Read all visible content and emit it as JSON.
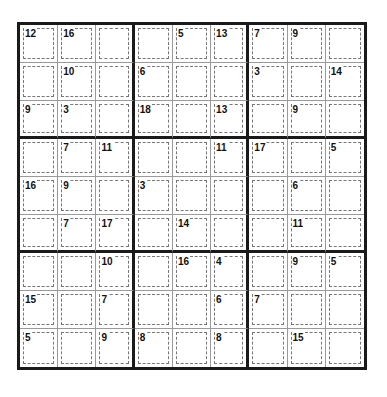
{
  "puzzle": {
    "type": "Killer Sudoku",
    "size": 9,
    "cage_sums": [
      [
        "12",
        "16",
        "",
        "",
        "5",
        "13",
        "7",
        "9",
        ""
      ],
      [
        "",
        "10",
        "",
        "6",
        "",
        "",
        "3",
        "",
        "14"
      ],
      [
        "9",
        "3",
        "",
        "18",
        "",
        "13",
        "",
        "9",
        ""
      ],
      [
        "",
        "7",
        "11",
        "",
        "",
        "11",
        "17",
        "",
        "5"
      ],
      [
        "16",
        "9",
        "",
        "3",
        "",
        "",
        "",
        "6",
        ""
      ],
      [
        "",
        "7",
        "17",
        "",
        "14",
        "",
        "",
        "11",
        ""
      ],
      [
        "",
        "",
        "10",
        "",
        "16",
        "4",
        "",
        "9",
        "5"
      ],
      [
        "15",
        "",
        "7",
        "",
        "",
        "6",
        "7",
        "",
        ""
      ],
      [
        "5",
        "",
        "9",
        "8",
        "",
        "8",
        "",
        "15",
        ""
      ]
    ]
  }
}
